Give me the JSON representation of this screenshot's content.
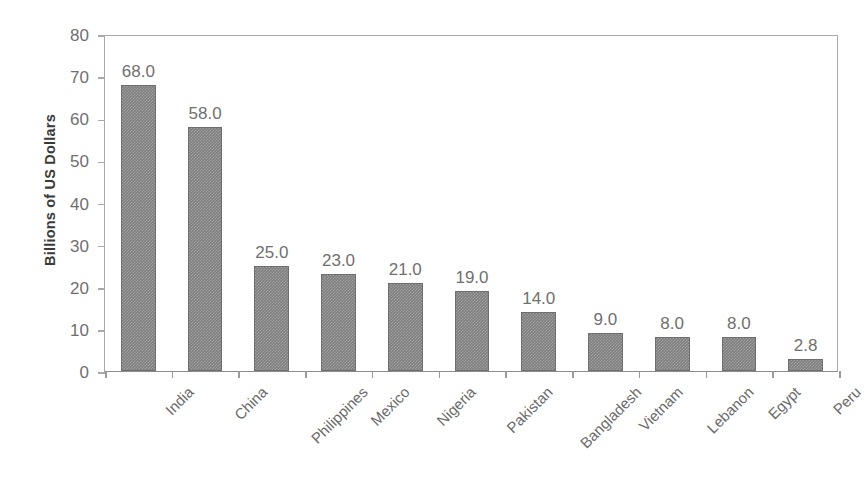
{
  "chart_data": {
    "type": "bar",
    "title": "",
    "subtitle": "",
    "xlabel": "",
    "ylabel": "Billions of US Dollars",
    "ylim": [
      0,
      80
    ],
    "ytick_step": 10,
    "yticks": [
      "80",
      "70",
      "60",
      "50",
      "40",
      "30",
      "20",
      "10",
      "0"
    ],
    "grid": false,
    "legend": false,
    "legend_position": "none",
    "bar_color": "#7f7f7f",
    "categories": [
      "India",
      "China",
      "Philippines",
      "Mexico",
      "Nigeria",
      "Pakistan",
      "Bangladesh",
      "Vietnam",
      "Lebanon",
      "Egypt",
      "Peru"
    ],
    "values": [
      68.0,
      58.0,
      25.0,
      23.0,
      21.0,
      19.0,
      14.0,
      9.0,
      8.0,
      8.0,
      2.8
    ],
    "value_labels": [
      "68.0",
      "58.0",
      "25.0",
      "23.0",
      "21.0",
      "19.0",
      "14.0",
      "9.0",
      "8.0",
      "8.0",
      "2.8"
    ]
  }
}
